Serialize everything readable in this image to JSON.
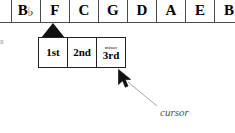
{
  "note_row": {
    "name": "note-name-strip",
    "cells": [
      {
        "label": "",
        "accidental": "",
        "partial": true,
        "selected": false
      },
      {
        "label": "B",
        "accidental": "♭",
        "partial": false,
        "selected": false
      },
      {
        "label": "F",
        "accidental": "",
        "partial": false,
        "selected": true
      },
      {
        "label": "C",
        "accidental": "",
        "partial": false,
        "selected": false
      },
      {
        "label": "G",
        "accidental": "",
        "partial": false,
        "selected": false
      },
      {
        "label": "D",
        "accidental": "",
        "partial": false,
        "selected": false
      },
      {
        "label": "A",
        "accidental": "",
        "partial": false,
        "selected": false
      },
      {
        "label": "E",
        "accidental": "",
        "partial": false,
        "selected": false
      },
      {
        "label": "B",
        "accidental": "",
        "partial": true,
        "selected": false
      }
    ]
  },
  "selection_marker": {
    "name": "selection-triangle",
    "points_to": "F",
    "color": "#111111"
  },
  "interval_box": {
    "name": "interval-popup",
    "cells": [
      {
        "qualifier": "",
        "name": "1st"
      },
      {
        "qualifier": "",
        "name": "2nd"
      },
      {
        "qualifier": "minor",
        "name": "3rd"
      }
    ]
  },
  "annotation": {
    "cursor_label": "cursor"
  },
  "margin_text": {
    "clipped_word": "es"
  },
  "colors": {
    "ink": "#000000",
    "grid_line": "#4a4a4a",
    "box_border": "#222222",
    "marker": "#111111",
    "annotation": "#4d4d4d",
    "leader": "#9a9a9a",
    "background": "#ffffff"
  }
}
